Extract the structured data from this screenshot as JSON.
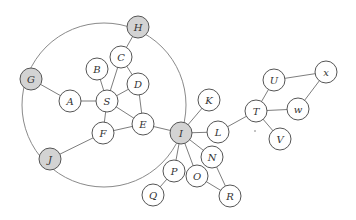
{
  "diagram": {
    "type": "graph",
    "colors": {
      "node_fill": "#ffffff",
      "highlight_fill": "#d3d3d3",
      "stroke": "#555555",
      "edge": "#6e6e6e"
    },
    "enclosing_circle": {
      "cx": 104,
      "cy": 105,
      "r": 82,
      "passes_through": [
        "H",
        "G",
        "J",
        "I"
      ]
    },
    "nodes": [
      {
        "id": "H",
        "label": "H",
        "x": 138,
        "y": 27,
        "highlighted": true
      },
      {
        "id": "G",
        "label": "G",
        "x": 31,
        "y": 79,
        "highlighted": true
      },
      {
        "id": "J",
        "label": "J",
        "x": 50,
        "y": 159,
        "highlighted": true
      },
      {
        "id": "I",
        "label": "I",
        "x": 181,
        "y": 133,
        "highlighted": true
      },
      {
        "id": "B",
        "label": "B",
        "x": 97,
        "y": 69,
        "highlighted": false
      },
      {
        "id": "C",
        "label": "C",
        "x": 121,
        "y": 57,
        "highlighted": false
      },
      {
        "id": "D",
        "label": "D",
        "x": 138,
        "y": 84,
        "highlighted": false
      },
      {
        "id": "A",
        "label": "A",
        "x": 70,
        "y": 101,
        "highlighted": false
      },
      {
        "id": "S",
        "label": "S",
        "x": 107,
        "y": 101,
        "highlighted": false
      },
      {
        "id": "F",
        "label": "F",
        "x": 103,
        "y": 133,
        "highlighted": false
      },
      {
        "id": "E",
        "label": "E",
        "x": 143,
        "y": 124,
        "highlighted": false
      },
      {
        "id": "K",
        "label": "K",
        "x": 209,
        "y": 100,
        "highlighted": false
      },
      {
        "id": "L",
        "label": "L",
        "x": 218,
        "y": 132,
        "highlighted": false
      },
      {
        "id": "N",
        "label": "N",
        "x": 212,
        "y": 157,
        "highlighted": false
      },
      {
        "id": "O",
        "label": "O",
        "x": 197,
        "y": 176,
        "highlighted": false
      },
      {
        "id": "P",
        "label": "P",
        "x": 174,
        "y": 171,
        "highlighted": false
      },
      {
        "id": "Q",
        "label": "Q",
        "x": 153,
        "y": 195,
        "highlighted": false
      },
      {
        "id": "R",
        "label": "R",
        "x": 230,
        "y": 196,
        "highlighted": false
      },
      {
        "id": "T",
        "label": "T",
        "x": 256,
        "y": 111,
        "highlighted": false
      },
      {
        "id": "U",
        "label": "U",
        "x": 274,
        "y": 80,
        "highlighted": false
      },
      {
        "id": "V",
        "label": "V",
        "x": 280,
        "y": 139,
        "highlighted": false
      },
      {
        "id": "w",
        "label": "w",
        "x": 298,
        "y": 109,
        "highlighted": false
      },
      {
        "id": "x",
        "label": "x",
        "x": 326,
        "y": 72,
        "highlighted": false
      }
    ],
    "edges": [
      [
        "H",
        "C"
      ],
      [
        "C",
        "S"
      ],
      [
        "C",
        "D"
      ],
      [
        "B",
        "S"
      ],
      [
        "G",
        "A"
      ],
      [
        "A",
        "S"
      ],
      [
        "S",
        "D"
      ],
      [
        "S",
        "E"
      ],
      [
        "S",
        "F"
      ],
      [
        "D",
        "E"
      ],
      [
        "F",
        "E"
      ],
      [
        "F",
        "J"
      ],
      [
        "E",
        "I"
      ],
      [
        "I",
        "K"
      ],
      [
        "I",
        "L"
      ],
      [
        "I",
        "N"
      ],
      [
        "I",
        "O"
      ],
      [
        "I",
        "P"
      ],
      [
        "P",
        "Q"
      ],
      [
        "N",
        "R"
      ],
      [
        "O",
        "R"
      ],
      [
        "L",
        "T"
      ],
      [
        "T",
        "U"
      ],
      [
        "T",
        "w"
      ],
      [
        "T",
        "V"
      ],
      [
        "U",
        "x"
      ],
      [
        "w",
        "x"
      ]
    ],
    "node_radius": 11
  }
}
